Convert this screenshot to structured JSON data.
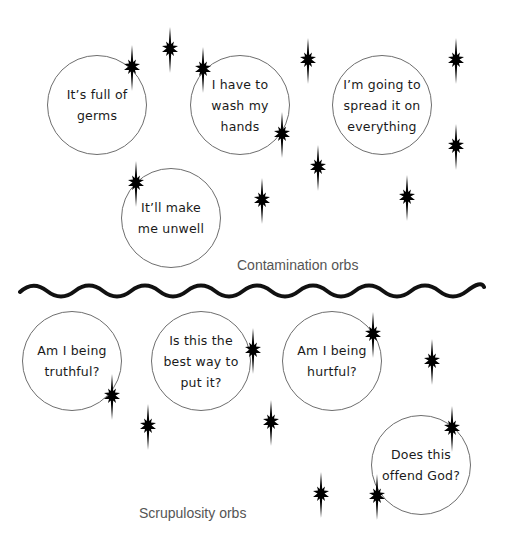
{
  "colors": {
    "background": "#ffffff",
    "orb_outline": "#6e6e6e",
    "text": "#1a1a1a",
    "caption": "#555555",
    "star": "#000000",
    "wave": "#111111"
  },
  "sections": {
    "contamination": {
      "caption": "Contamination orbs",
      "orbs": [
        {
          "text": "It’s full of\ngerms",
          "cx": 97,
          "cy": 105,
          "r": 50
        },
        {
          "text": "I have to\nwash my\nhands",
          "cx": 240,
          "cy": 105,
          "r": 50
        },
        {
          "text": "I’m going to\nspread it on\neverything",
          "cx": 382,
          "cy": 105,
          "r": 50
        },
        {
          "text": "It’ll make\nme unwell",
          "cx": 171,
          "cy": 218,
          "r": 50
        }
      ]
    },
    "divider": {
      "type": "wavy-line"
    },
    "scrupulosity": {
      "caption": "Scrupulosity orbs",
      "orbs": [
        {
          "text": "Am I being\ntruthful?",
          "cx": 72,
          "cy": 361,
          "r": 50
        },
        {
          "text": "Is this the\nbest way to\nput it?",
          "cx": 201,
          "cy": 361,
          "r": 50
        },
        {
          "text": "Am I being\nhurtful?",
          "cx": 332,
          "cy": 361,
          "r": 50
        },
        {
          "text": "Does this\noffend God?",
          "cx": 421,
          "cy": 465,
          "r": 50
        }
      ]
    }
  },
  "stars": [
    {
      "x": 170,
      "y": 49
    },
    {
      "x": 132,
      "y": 67
    },
    {
      "x": 203,
      "y": 69
    },
    {
      "x": 308,
      "y": 60
    },
    {
      "x": 456,
      "y": 60
    },
    {
      "x": 282,
      "y": 134
    },
    {
      "x": 318,
      "y": 167
    },
    {
      "x": 456,
      "y": 146
    },
    {
      "x": 136,
      "y": 183
    },
    {
      "x": 262,
      "y": 200
    },
    {
      "x": 407,
      "y": 197
    },
    {
      "x": 112,
      "y": 396
    },
    {
      "x": 148,
      "y": 426
    },
    {
      "x": 271,
      "y": 422
    },
    {
      "x": 373,
      "y": 334
    },
    {
      "x": 432,
      "y": 361
    },
    {
      "x": 452,
      "y": 428
    },
    {
      "x": 321,
      "y": 494
    },
    {
      "x": 377,
      "y": 496
    },
    {
      "x": 253,
      "y": 350
    }
  ]
}
